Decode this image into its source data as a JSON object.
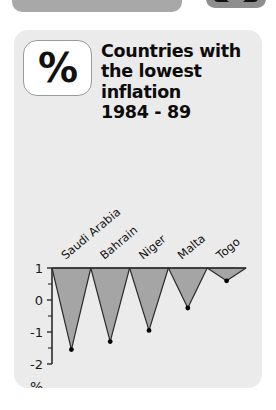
{
  "top_chrome": {
    "left_bar_name": "window-title-bar-partial",
    "right_badge_name": "status-badge-partial"
  },
  "card": {
    "background_color": "#ebebeb",
    "icon": {
      "name": "percent-icon",
      "glyph": "%"
    },
    "title_lines": [
      "Countries with",
      "the lowest",
      "inflation",
      "1984 - 89"
    ]
  },
  "chart_data": {
    "type": "area",
    "title": "Countries with the lowest inflation 1984 - 89",
    "categories": [
      "Saudi Arabia",
      "Bahrain",
      "Niger",
      "Malta",
      "Togo"
    ],
    "values": [
      -1.55,
      -1.3,
      -0.95,
      -0.25,
      0.6
    ],
    "baseline": 1,
    "xlabel": "",
    "ylabel": "%",
    "ylim": [
      -2,
      1
    ],
    "yticks": [
      1,
      0,
      -1,
      -2
    ],
    "ytick_labels": [
      "1",
      "0",
      "-1",
      "-2"
    ],
    "grid": false,
    "legend": "none",
    "series_fill_color": "#a5a5a5",
    "series_line_color": "#2b2b2b",
    "marker": "dot"
  }
}
